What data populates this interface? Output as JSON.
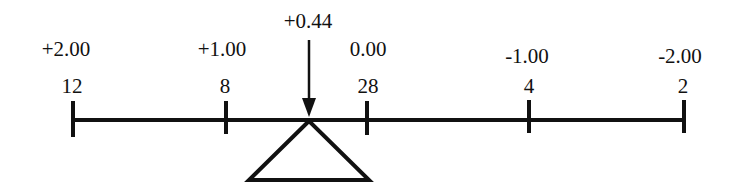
{
  "diagram": {
    "title": "",
    "type": "balance-beam",
    "colors": {
      "ink": "#111111",
      "background": "#ffffff"
    },
    "fulcrum": {
      "label": "+0.44",
      "value": 0.44,
      "icon": "down-arrow-icon",
      "support_icon": "triangle-fulcrum-icon"
    },
    "ticks": [
      {
        "top_label": "+2.00",
        "bottom_label": "12"
      },
      {
        "top_label": "+1.00",
        "bottom_label": "8"
      },
      {
        "top_label": "0.00",
        "bottom_label": "28"
      },
      {
        "top_label": "-1.00",
        "bottom_label": "4"
      },
      {
        "top_label": "-2.00",
        "bottom_label": "2"
      }
    ]
  }
}
